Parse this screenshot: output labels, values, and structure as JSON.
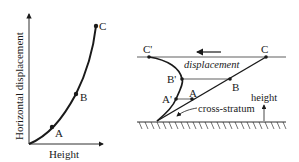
{
  "left_plot": {
    "xlabel": "Height",
    "ylabel": "Horizontal displacement",
    "points": [
      {
        "label": "A"
      },
      {
        "label": "B"
      },
      {
        "label": "C"
      }
    ]
  },
  "right_diagram": {
    "points": [
      {
        "label": "C'"
      },
      {
        "label": "C"
      },
      {
        "label": "B'"
      },
      {
        "label": "B"
      },
      {
        "label": "A'"
      },
      {
        "label": "A"
      }
    ],
    "displacement_label": "displacement",
    "cross_stratum_label": "cross-stratum",
    "height_label": "height"
  },
  "colors": {
    "ink": "#1a1a1a",
    "background": "#ffffff"
  }
}
